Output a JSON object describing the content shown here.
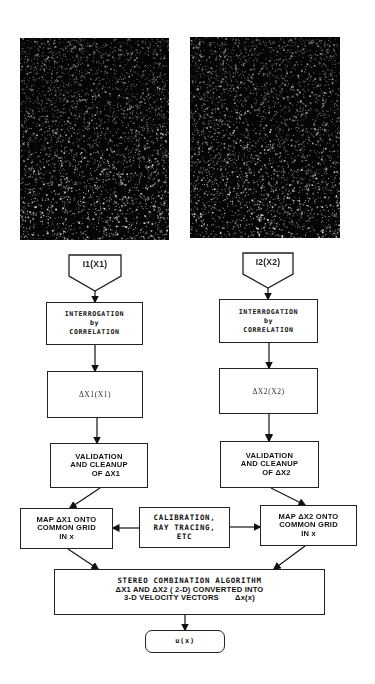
{
  "diagram": {
    "images": [
      {
        "id": "camera-1",
        "label": "Camera 1 particle image"
      },
      {
        "id": "camera-2",
        "label": "Camera 2 particle image"
      }
    ],
    "left_branch": {
      "input": "I1(X1)",
      "interrogation": [
        "INTERROGATION",
        "by",
        "CORRELATION"
      ],
      "displacement": "ΔX1(X1)",
      "validation": [
        "VALIDATION",
        "AND CLEANUP",
        "OF ΔX1"
      ],
      "map": [
        "MAP  ΔX1 ONTO",
        "COMMON GRID",
        "IN x"
      ]
    },
    "right_branch": {
      "input": "I2(X2)",
      "interrogation": [
        "INTERROGATION",
        "by",
        "CORRELATION"
      ],
      "displacement": "ΔX2(X2)",
      "validation": [
        "VALIDATION",
        "AND CLEANUP",
        "OF ΔX2"
      ],
      "map": [
        "MAP  ΔX2 ONTO",
        "COMMON GRID",
        "IN x"
      ]
    },
    "calibration": [
      "CALIBRATION,",
      "RAY TRACING,",
      "ETC"
    ],
    "stereo": {
      "title": "STEREO COMBINATION ALGORITHM",
      "line2": "ΔX1 AND  ΔX2 ( 2-D) CONVERTED INTO",
      "line3": "3-D VELOCITY VECTORS       Δx(x)"
    },
    "output": "u(x)"
  }
}
